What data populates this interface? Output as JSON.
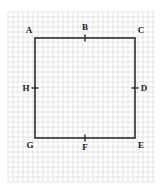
{
  "diagram": {
    "type": "square-on-grid",
    "grid": {
      "x0": 8,
      "y0": 12,
      "x1": 155,
      "y1": 182,
      "cell": 10,
      "color": "#d4d4d4"
    },
    "square": {
      "x": 35,
      "y": 38,
      "size": 100,
      "stroke": "#2b2b2b"
    },
    "points": [
      {
        "id": "A",
        "label": "A",
        "role": "corner-top-left",
        "x": 35,
        "y": 38,
        "lx": 29,
        "ly": 33
      },
      {
        "id": "B",
        "label": "B",
        "role": "midpoint-top",
        "x": 85,
        "y": 38,
        "lx": 85,
        "ly": 30
      },
      {
        "id": "C",
        "label": "C",
        "role": "corner-top-right",
        "x": 135,
        "y": 38,
        "lx": 141,
        "ly": 33
      },
      {
        "id": "D",
        "label": "D",
        "role": "midpoint-right",
        "x": 135,
        "y": 88,
        "lx": 144,
        "ly": 91
      },
      {
        "id": "E",
        "label": "E",
        "role": "corner-bottom-right",
        "x": 135,
        "y": 138,
        "lx": 141,
        "ly": 148
      },
      {
        "id": "F",
        "label": "F",
        "role": "midpoint-bottom",
        "x": 85,
        "y": 138,
        "lx": 85,
        "ly": 150
      },
      {
        "id": "G",
        "label": "G",
        "role": "corner-bottom-left",
        "x": 35,
        "y": 138,
        "lx": 30,
        "ly": 148
      },
      {
        "id": "H",
        "label": "H",
        "role": "midpoint-left",
        "x": 35,
        "y": 88,
        "lx": 26,
        "ly": 91
      }
    ]
  }
}
